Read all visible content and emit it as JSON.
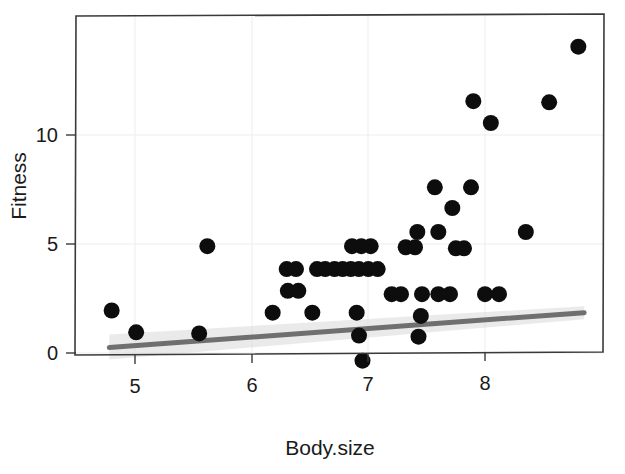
{
  "chart_data": {
    "type": "scatter",
    "title": "",
    "xlabel": "Body.size",
    "ylabel": "Fitness",
    "xlim": [
      4.62,
      8.92
    ],
    "ylim": [
      -0.95,
      14.75
    ],
    "xticks": [
      5,
      6,
      7,
      8
    ],
    "xtick_labels": [
      "5",
      "6",
      "7",
      "8"
    ],
    "yticks": [
      0,
      5,
      10
    ],
    "ytick_labels": [
      "0",
      "5",
      "10"
    ],
    "grid": "major-gridlines-light-gray",
    "legend": "none",
    "point_color": "#0d0d0d",
    "point_radius_px": 8,
    "line_color": "#6f6f6f",
    "band_color": "#d8d8d8",
    "points": [
      {
        "x": 4.8,
        "y": 1.95
      },
      {
        "x": 5.01,
        "y": 0.95
      },
      {
        "x": 5.55,
        "y": 0.9
      },
      {
        "x": 5.62,
        "y": 4.9
      },
      {
        "x": 6.18,
        "y": 1.85
      },
      {
        "x": 6.3,
        "y": 3.85
      },
      {
        "x": 6.38,
        "y": 3.85
      },
      {
        "x": 6.31,
        "y": 2.85
      },
      {
        "x": 6.4,
        "y": 2.85
      },
      {
        "x": 6.52,
        "y": 1.85
      },
      {
        "x": 6.56,
        "y": 3.85
      },
      {
        "x": 6.63,
        "y": 3.85
      },
      {
        "x": 6.71,
        "y": 3.85
      },
      {
        "x": 6.78,
        "y": 3.85
      },
      {
        "x": 6.85,
        "y": 3.85
      },
      {
        "x": 6.92,
        "y": 3.85
      },
      {
        "x": 6.86,
        "y": 4.9
      },
      {
        "x": 6.94,
        "y": 4.9
      },
      {
        "x": 7.02,
        "y": 4.9
      },
      {
        "x": 6.9,
        "y": 1.85
      },
      {
        "x": 6.92,
        "y": 0.8
      },
      {
        "x": 6.95,
        "y": -0.35
      },
      {
        "x": 7.0,
        "y": 3.85
      },
      {
        "x": 7.08,
        "y": 3.85
      },
      {
        "x": 7.2,
        "y": 2.7
      },
      {
        "x": 7.28,
        "y": 2.7
      },
      {
        "x": 7.32,
        "y": 4.85
      },
      {
        "x": 7.4,
        "y": 4.85
      },
      {
        "x": 7.42,
        "y": 5.55
      },
      {
        "x": 7.45,
        "y": 1.7
      },
      {
        "x": 7.43,
        "y": 0.75
      },
      {
        "x": 7.46,
        "y": 2.7
      },
      {
        "x": 7.57,
        "y": 7.6
      },
      {
        "x": 7.6,
        "y": 5.55
      },
      {
        "x": 7.6,
        "y": 2.7
      },
      {
        "x": 7.7,
        "y": 2.7
      },
      {
        "x": 7.72,
        "y": 6.65
      },
      {
        "x": 7.75,
        "y": 4.8
      },
      {
        "x": 7.82,
        "y": 4.8
      },
      {
        "x": 7.88,
        "y": 7.6
      },
      {
        "x": 7.9,
        "y": 11.55
      },
      {
        "x": 8.05,
        "y": 10.55
      },
      {
        "x": 8.0,
        "y": 2.7
      },
      {
        "x": 8.12,
        "y": 2.7
      },
      {
        "x": 8.35,
        "y": 5.55
      },
      {
        "x": 8.55,
        "y": 11.5
      },
      {
        "x": 8.8,
        "y": 14.05
      }
    ],
    "fit_line": {
      "x_start": 4.78,
      "y_start": 0.25,
      "x_end": 8.85,
      "y_end": 1.85,
      "description": "linear regression trend line, gray"
    },
    "confidence_band": {
      "x_start": 4.78,
      "x_end": 8.85,
      "lower_start": -0.3,
      "upper_start": 0.85,
      "lower_end": 1.55,
      "upper_end": 2.15,
      "description": "light gray standard-error ribbon around fit"
    }
  }
}
